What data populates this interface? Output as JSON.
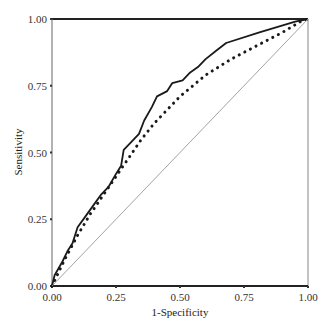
{
  "chart_data": {
    "type": "line",
    "title": "",
    "xlabel": "1-Specificity",
    "ylabel": "Sensitivity",
    "xlim": [
      0,
      1
    ],
    "ylim": [
      0,
      1
    ],
    "grid": false,
    "legend": null,
    "x_ticks": [
      "0.00",
      "0.25",
      "0.50",
      "0.75",
      "1.00"
    ],
    "y_ticks": [
      "0.00",
      "0.25",
      "0.50",
      "0.75",
      "1.00"
    ],
    "series": [
      {
        "name": "ROC curve (solid)",
        "style": "solid",
        "color": "#1a1a1a",
        "x": [
          0,
          0.01,
          0.04,
          0.06,
          0.08,
          0.1,
          0.13,
          0.16,
          0.19,
          0.22,
          0.25,
          0.27,
          0.28,
          0.31,
          0.34,
          0.36,
          0.39,
          0.41,
          0.45,
          0.47,
          0.51,
          0.54,
          0.57,
          0.6,
          0.64,
          0.68,
          0.81,
          0.95,
          1.0
        ],
        "y": [
          0,
          0.04,
          0.09,
          0.13,
          0.16,
          0.22,
          0.26,
          0.3,
          0.34,
          0.37,
          0.42,
          0.45,
          0.51,
          0.54,
          0.57,
          0.62,
          0.67,
          0.71,
          0.73,
          0.76,
          0.77,
          0.8,
          0.82,
          0.85,
          0.88,
          0.91,
          0.95,
          0.99,
          1.0
        ]
      },
      {
        "name": "ROC curve (dotted)",
        "style": "dotted",
        "color": "#1a1a1a",
        "x": [
          0,
          0.05,
          0.1,
          0.15,
          0.2,
          0.25,
          0.3,
          0.35,
          0.4,
          0.45,
          0.5,
          0.55,
          0.6,
          0.7,
          0.8,
          0.9,
          0.97,
          1.0
        ],
        "y": [
          0,
          0.1,
          0.19,
          0.27,
          0.34,
          0.41,
          0.48,
          0.55,
          0.61,
          0.66,
          0.71,
          0.75,
          0.79,
          0.85,
          0.9,
          0.95,
          0.99,
          1.0
        ]
      },
      {
        "name": "Reference line",
        "style": "thin",
        "color": "#999999",
        "x": [
          0,
          1
        ],
        "y": [
          0,
          1
        ]
      }
    ]
  },
  "axes": {
    "x_title": "1-Specificity",
    "y_title": "Sensitivity",
    "x_tick_labels": [
      "0.00",
      "0.25",
      "0.50",
      "0.75",
      "1.00"
    ],
    "y_tick_labels": [
      "0.00",
      "0.25",
      "0.50",
      "0.75",
      "1.00"
    ]
  }
}
